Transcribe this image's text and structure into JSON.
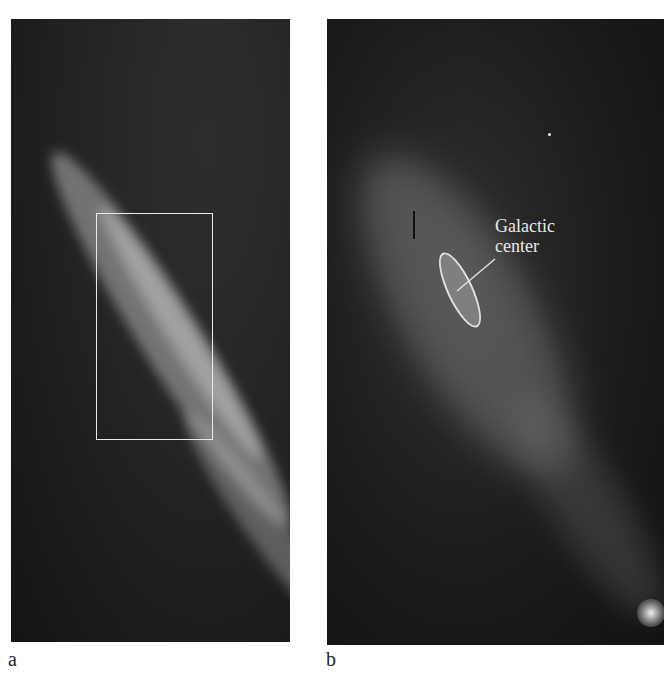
{
  "figure": {
    "panels": [
      {
        "id": "a",
        "label": "a",
        "description": "Infrared image of Milky Way band running diagonally from top-left to bottom-right with a rectangular box marking a region",
        "box_color": "#e8e8e8"
      },
      {
        "id": "b",
        "label": "b",
        "description": "Zoomed view of boxed region showing the galactic center",
        "annotation": {
          "line1": "Galactic",
          "line2": "center"
        }
      }
    ],
    "colors": {
      "background": "#ffffff",
      "image_dark": "#1f1f1f",
      "glow": "#bdbdbd",
      "annotation": "#e8e8e8"
    }
  }
}
